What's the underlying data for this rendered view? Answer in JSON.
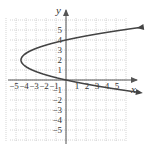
{
  "chart_data": {
    "type": "line",
    "title": "",
    "xlabel": "x",
    "ylabel": "y",
    "xlim": [
      -5.5,
      6
    ],
    "ylim": [
      -6,
      6
    ],
    "grid": true,
    "x_ticks": [
      "-5",
      "-4",
      "-3",
      "-2",
      "-1",
      "1",
      "2",
      "3",
      "4",
      "5"
    ],
    "y_ticks": [
      "5",
      "4",
      "3",
      "2",
      "1",
      "-1",
      "-2",
      "-3",
      "-4",
      "-5"
    ],
    "series": [
      {
        "name": "parabola x = (y-2)^2 - 4",
        "vertex": [
          -4.5,
          2
        ],
        "points": [
          [
            5.5,
            5.2
          ],
          [
            3,
            4.8
          ],
          [
            0,
            4.1
          ],
          [
            -2,
            3.4
          ],
          [
            -3.5,
            2.8
          ],
          [
            -4.5,
            2.0
          ],
          [
            -3.5,
            1.2
          ],
          [
            -2,
            0.6
          ],
          [
            0,
            0
          ],
          [
            3,
            -0.7
          ],
          [
            5.5,
            -1.2
          ]
        ],
        "arrows": "both ends"
      }
    ]
  },
  "labels": {
    "x_axis": "x",
    "y_axis": "y"
  }
}
